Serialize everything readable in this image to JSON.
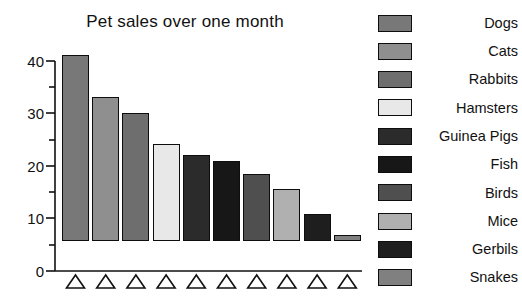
{
  "chart_data": {
    "type": "bar",
    "title": "Pet sales over one month",
    "xlabel": "",
    "ylabel": "",
    "ylim": [
      0,
      40
    ],
    "yticks": [
      0,
      10,
      20,
      30,
      40
    ],
    "ytick_labels": [
      "0",
      "10",
      "20",
      "30",
      "40"
    ],
    "minor_yticks": [
      5,
      15,
      25,
      35
    ],
    "grid": false,
    "legend_position": "right",
    "categories": [
      "Dogs",
      "Cats",
      "Rabbits",
      "Hamsters",
      "Guinea Pigs",
      "Fish",
      "Birds",
      "Mice",
      "Gerbils",
      "Snakes"
    ],
    "values": [
      35.5,
      27.5,
      24.3,
      18.5,
      16.3,
      15.2,
      12.7,
      10.0,
      5.2,
      1.1
    ],
    "colors": [
      "#787878",
      "#8f8f8f",
      "#6e6e6e",
      "#e8e8e8",
      "#2b2b2b",
      "#171717",
      "#4f4f4f",
      "#b0b0b0",
      "#1e1e1e",
      "#808080"
    ],
    "bar_edge_color": "#0d0d0d",
    "x_marker": "open-triangle",
    "x_marker_count": 10
  },
  "chart": {
    "title": "Pet sales over one month",
    "axis": {
      "y_tick_labels": [
        "40",
        "30",
        "20",
        "10",
        "0"
      ]
    }
  },
  "legend": {
    "items": [
      {
        "label": "Dogs",
        "color": "#787878"
      },
      {
        "label": "Cats",
        "color": "#8f8f8f"
      },
      {
        "label": "Rabbits",
        "color": "#6e6e6e"
      },
      {
        "label": "Hamsters",
        "color": "#e8e8e8"
      },
      {
        "label": "Guinea Pigs",
        "color": "#2b2b2b"
      },
      {
        "label": "Fish",
        "color": "#171717"
      },
      {
        "label": "Birds",
        "color": "#4f4f4f"
      },
      {
        "label": "Mice",
        "color": "#b0b0b0"
      },
      {
        "label": "Gerbils",
        "color": "#1e1e1e"
      },
      {
        "label": "Snakes",
        "color": "#808080"
      }
    ]
  }
}
